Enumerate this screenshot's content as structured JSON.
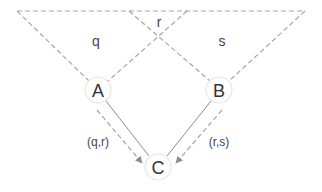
{
  "diagram": {
    "regions": [
      {
        "id": "q",
        "label": "q"
      },
      {
        "id": "r",
        "label": "r"
      },
      {
        "id": "s",
        "label": "s"
      }
    ],
    "nodes": [
      {
        "id": "A",
        "label": "A"
      },
      {
        "id": "B",
        "label": "B"
      },
      {
        "id": "C",
        "label": "C"
      }
    ],
    "edges": [
      {
        "from": "A",
        "to": "C",
        "label": "(q,r)"
      },
      {
        "from": "B",
        "to": "C",
        "label": "(r,s)"
      }
    ],
    "colors": {
      "dashed_line": "#a6a6a6",
      "solid_line": "#8c8c8c",
      "node_border": "#e6e6e6",
      "text": "#333333"
    }
  }
}
